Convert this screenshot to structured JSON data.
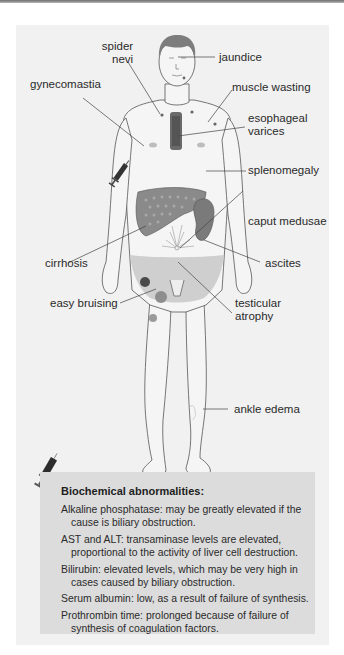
{
  "figure": {
    "labels": {
      "spider_nevi_1": "spider",
      "spider_nevi_2": "nevi",
      "jaundice": "jaundice",
      "gynecomastia": "gynecomastia",
      "muscle_wasting": "muscle wasting",
      "esophageal_varices_1": "esophageal",
      "esophageal_varices_2": "varices",
      "splenomegaly": "splenomegaly",
      "caput_medusae": "caput medusae",
      "cirrhosis": "cirrhosis",
      "ascites": "ascites",
      "easy_bruising": "easy bruising",
      "testicular_atrophy_1": "testicular",
      "testicular_atrophy_2": "atrophy",
      "ankle_edema": "ankle edema"
    },
    "icons": [
      "syringe-icon",
      "syringe-icon"
    ],
    "colors": {
      "panel": "#f1f1f1",
      "box": "#dcdcdc",
      "liver": "#8a8a8a",
      "spleen": "#7a7a7a",
      "ascites": "#cfcfcf",
      "varices": "#6a6a6a",
      "skin": "#f4f4f4",
      "outline": "#555555"
    }
  },
  "biochem": {
    "title": "Biochemical abnormalities:",
    "items": [
      {
        "line1": "Alkaline phosphatase: may be greatly elevated if the",
        "line2": "cause is biliary obstruction."
      },
      {
        "line1": "AST and ALT: transaminase levels are elevated,",
        "line2": "proportional to the activity of liver cell destruction."
      },
      {
        "line1": "Bilirubin: elevated levels, which may be very high in",
        "line2": "cases caused by biliary obstruction."
      },
      {
        "line1": "Serum albumin: low, as a result of failure of synthesis.",
        "line2": ""
      },
      {
        "line1": "Prothrombin time: prolonged because of failure of",
        "line2": "synthesis of coagulation factors."
      }
    ]
  }
}
